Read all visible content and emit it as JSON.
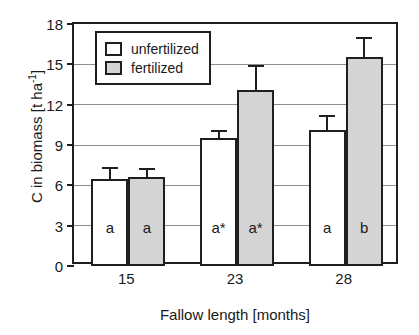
{
  "chart_data": {
    "type": "bar",
    "title": "",
    "xlabel": "Fallow length [months]",
    "ylabel": "C in biomass [t ha-1]",
    "ylabel_base": "C in biomass [t ha",
    "ylabel_exponent": "-1",
    "ylabel_close": "]",
    "categories": [
      "15",
      "23",
      "28"
    ],
    "ylim": [
      0,
      18
    ],
    "yticks": [
      0,
      3,
      6,
      9,
      12,
      15,
      18
    ],
    "ytick_labels": [
      "0",
      "3",
      "6",
      "9",
      "12",
      "15",
      "18"
    ],
    "grid": true,
    "legend_position": "upper-left-inside",
    "series": [
      {
        "name": "unfertilized",
        "fill": "#ffffff",
        "values": [
          6.5,
          9.5,
          10.15
        ],
        "errors_upper": [
          7.4,
          10.1,
          11.25
        ],
        "point_labels": [
          "a",
          "a*",
          "a"
        ]
      },
      {
        "name": "fertilized",
        "fill": "#d4d4d4",
        "values": [
          6.6,
          13.1,
          15.55
        ],
        "errors_upper": [
          7.3,
          14.95,
          17.05
        ],
        "point_labels": [
          "a",
          "a*",
          "b"
        ]
      }
    ]
  },
  "legend": {
    "entries": [
      {
        "label": "unfertilized",
        "swatch": "unfertilized"
      },
      {
        "label": "fertilized",
        "swatch": "fertilized"
      }
    ]
  },
  "colors": {
    "axis": "#1f1f1f",
    "grid": "#8e8e8e",
    "unfertilized_fill": "#ffffff",
    "fertilized_fill": "#d4d4d4",
    "background": "#ffffff"
  }
}
